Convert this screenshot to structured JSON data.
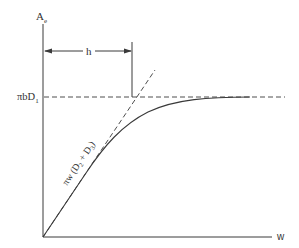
{
  "diagram": {
    "type": "engineering-plot",
    "colors": {
      "line": "#3a3a3a",
      "text": "#333333",
      "background": "#ffffff"
    },
    "axes": {
      "y_label_main": "A",
      "y_label_sub": "e",
      "x_label": "w"
    },
    "asymptote": {
      "label_prefix": "πbD",
      "label_sub": "1",
      "style": "dashed"
    },
    "dimension": {
      "label": "h",
      "style": "double-arrow"
    },
    "tangent": {
      "label_prefix": "πw (D",
      "label_sub1": "2",
      "label_mid": " + D",
      "label_sub2": "3",
      "label_suffix": ")",
      "style": "dashed"
    },
    "curve": {
      "description": "A_e vs w, rises linearly from origin along tangent then saturates at πbD1",
      "style": "solid"
    }
  }
}
